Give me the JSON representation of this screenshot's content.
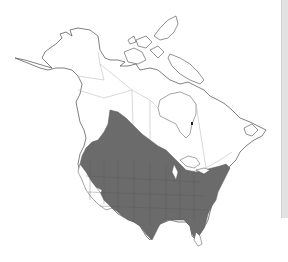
{
  "map": {
    "region": "North America",
    "type": "species-range-map",
    "colors": {
      "background": "#ffffff",
      "land_fill": "#ffffff",
      "coastline": "#4a4a4a",
      "political_borders": "#bdbdbd",
      "range_fill": "#6b6b6b",
      "side_strip": "#e2e2e2"
    },
    "range_extent": "Southern Canadian prairies and continental United States south to Mexico border; excludes Pacific Southwest deserts and southern Florida"
  }
}
